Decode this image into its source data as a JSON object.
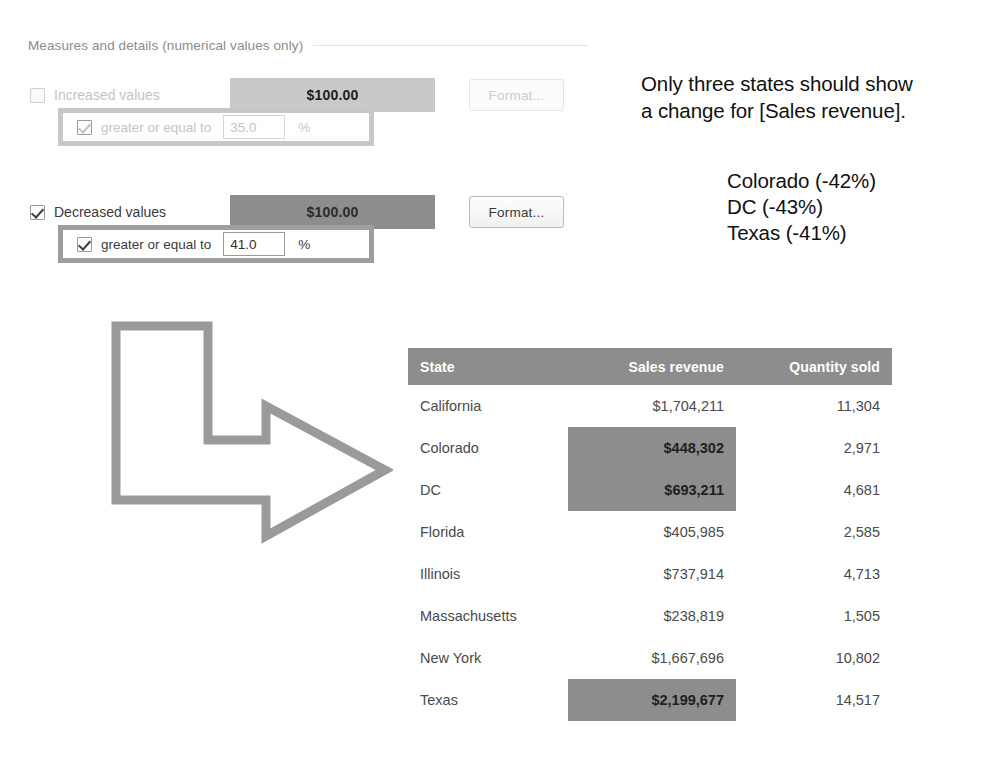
{
  "top_artifact": "",
  "section": {
    "title": "Measures and details (numerical values only)"
  },
  "rules": [
    {
      "id": "increased",
      "checkbox_label": "Increased values",
      "checked": false,
      "enabled": false,
      "sample_text": "$100.00",
      "sample_color": "#c9c9c9",
      "format_button": "Format...",
      "condition": {
        "checked": true,
        "label": "greater or equal to",
        "value": "35.0",
        "unit": "%"
      }
    },
    {
      "id": "decreased",
      "checkbox_label": "Decreased values",
      "checked": true,
      "enabled": true,
      "sample_text": "$100.00",
      "sample_color": "#8d8d8d",
      "format_button": "Format...",
      "condition": {
        "checked": true,
        "label": "greater or equal to",
        "value": "41.0",
        "unit": "%"
      }
    }
  ],
  "annotation": {
    "line1": "Only three states should show",
    "line2": "a change for [Sales revenue].",
    "items": [
      "Colorado (-42%)",
      "DC (-43%)",
      "Texas (-41%)"
    ]
  },
  "arrow": {
    "name": "bent-arrow-right",
    "stroke_color": "#9a9a9a"
  },
  "table": {
    "columns": [
      "State",
      "Sales revenue",
      "Quantity sold"
    ],
    "header_bg": "#8d8d8d",
    "highlight_bg": "#8d8d8d",
    "rows": [
      {
        "state": "California",
        "revenue": "$1,704,211",
        "quantity": "11,304",
        "highlighted": false
      },
      {
        "state": "Colorado",
        "revenue": "$448,302",
        "quantity": "2,971",
        "highlighted": true
      },
      {
        "state": "DC",
        "revenue": "$693,211",
        "quantity": "4,681",
        "highlighted": true
      },
      {
        "state": "Florida",
        "revenue": "$405,985",
        "quantity": "2,585",
        "highlighted": false
      },
      {
        "state": "Illinois",
        "revenue": "$737,914",
        "quantity": "4,713",
        "highlighted": false
      },
      {
        "state": "Massachusetts",
        "revenue": "$238,819",
        "quantity": "1,505",
        "highlighted": false
      },
      {
        "state": "New York",
        "revenue": "$1,667,696",
        "quantity": "10,802",
        "highlighted": false
      },
      {
        "state": "Texas",
        "revenue": "$2,199,677",
        "quantity": "14,517",
        "highlighted": true
      }
    ]
  }
}
